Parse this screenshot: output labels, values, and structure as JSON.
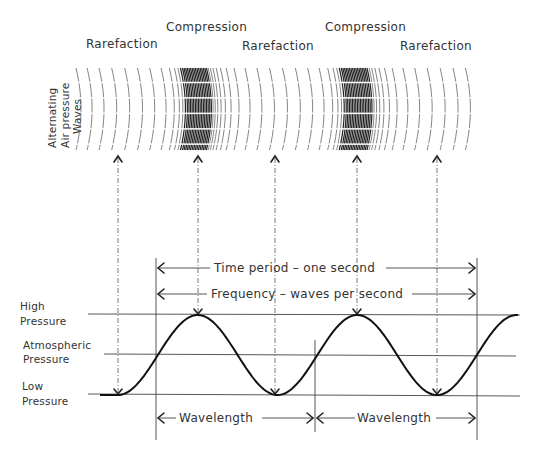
{
  "diagram": {
    "top_labels": [
      {
        "id": "rarefaction-1",
        "text": "Rarefaction"
      },
      {
        "id": "compression-1",
        "text": "Compression"
      },
      {
        "id": "rarefaction-2",
        "text": "Rarefaction"
      },
      {
        "id": "compression-2",
        "text": "Compression"
      },
      {
        "id": "rarefaction-3",
        "text": "Rarefaction"
      }
    ],
    "side_label": [
      "Alternating",
      "Air pressure",
      "Waves"
    ],
    "pressure_levels": [
      {
        "id": "high",
        "lines": [
          "High",
          "Pressure"
        ]
      },
      {
        "id": "atmospheric",
        "lines": [
          "Atmospheric",
          "Pressure"
        ]
      },
      {
        "id": "low",
        "lines": [
          "Low",
          "Pressure"
        ]
      }
    ],
    "dimension_labels": {
      "time_period": "Time period – one second",
      "frequency": "Frequency – waves per second",
      "wavelength_1": "Wavelength",
      "wavelength_2": "Wavelength"
    },
    "wave": {
      "cycles_shown": 2,
      "phase_markers": [
        "low",
        "high",
        "low",
        "high",
        "low"
      ]
    }
  }
}
